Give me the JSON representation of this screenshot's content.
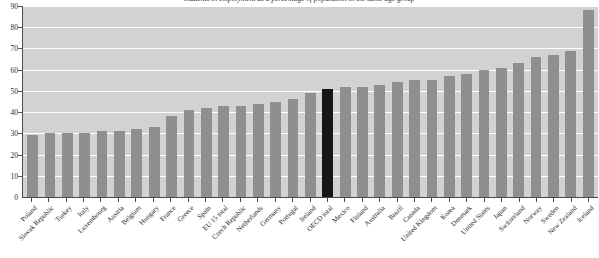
{
  "chart_data": {
    "type": "bar",
    "title": "Students in employment as a percentage of population in the same age group",
    "xlabel": "",
    "ylabel": "",
    "ylim": [
      0,
      90
    ],
    "ytick_step": 10,
    "yticks": [
      0,
      10,
      20,
      30,
      40,
      50,
      60,
      70,
      80,
      90
    ],
    "grid": true,
    "legend": "none",
    "plot_background": "#d2d2d2",
    "bar_color": "#8f8f8f",
    "highlight_color": "#171717",
    "highlight_category": "OECD total",
    "categories": [
      "Poland",
      "Slovak Republic",
      "Turkey",
      "Italy",
      "Luxembourg",
      "Austria",
      "Belgium",
      "Hungary",
      "France",
      "Greece",
      "Spain",
      "EU 15 total",
      "Czech Republic",
      "Netherlands",
      "Germany",
      "Portugal",
      "Ireland",
      "OECD total",
      "Mexico",
      "Finland",
      "Australia",
      "Brazil",
      "Canada",
      "United Kingdom",
      "Korea",
      "Denmark",
      "United States",
      "Japan",
      "Switzerland",
      "Norway",
      "Sweden",
      "New Zealand",
      "Iceland"
    ],
    "values": [
      29,
      30,
      30,
      30,
      31,
      31,
      32,
      33,
      38,
      41,
      42,
      43,
      43,
      44,
      45,
      46,
      49,
      51,
      52,
      52,
      53,
      54,
      55,
      55,
      57,
      58,
      60,
      61,
      63,
      66,
      67,
      69,
      88
    ]
  }
}
